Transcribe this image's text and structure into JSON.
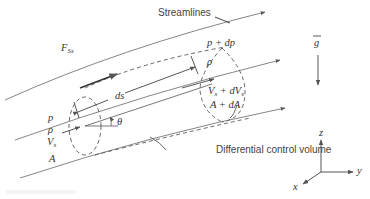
{
  "diagram": {
    "labels": {
      "streamlines": "Streamlines",
      "control_volume": "Differential control volume",
      "force": "F",
      "force_sub": "Ss",
      "ds": "ds",
      "theta": "θ",
      "inlet_p": "p",
      "inlet_rho": "ρ",
      "inlet_V": "V",
      "inlet_V_sub": "s",
      "inlet_A": "A",
      "outlet_p": "p + dp",
      "outlet_rho": "ρ",
      "outlet_V": "V",
      "outlet_V_sub": "s",
      "outlet_V_plus": " + dV",
      "outlet_dV_sub": "s",
      "outlet_A": "A + dA",
      "gravity": "g",
      "axis_x": "x",
      "axis_y": "y",
      "axis_z": "z"
    },
    "colors": {
      "stroke": "#555555",
      "text": "#333333",
      "background": "#ffffff"
    }
  }
}
